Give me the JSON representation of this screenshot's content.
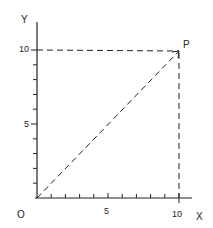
{
  "diagram": {
    "axes": {
      "x_label": "X",
      "y_label": "Y",
      "origin_label": "O",
      "x_ticks": [
        5,
        10
      ],
      "y_ticks": [
        5,
        10
      ],
      "x_range": [
        0,
        10
      ],
      "y_range": [
        0,
        10
      ],
      "minor_tick_step": 1
    },
    "point": {
      "label": "P",
      "x": 10,
      "y": 10
    },
    "lines": [
      {
        "from": "O",
        "to": "P",
        "style": "dashed"
      },
      {
        "from": "P",
        "to": "y-axis at 10",
        "style": "dashed"
      },
      {
        "from": "P",
        "to": "x-axis at 10",
        "style": "dashed"
      }
    ],
    "colors": {
      "ink": "#222222",
      "background": "#ffffff"
    }
  }
}
